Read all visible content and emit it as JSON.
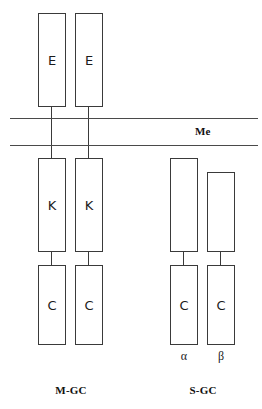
{
  "figure": {
    "membrane": {
      "label": "Me",
      "line_color": "#4a4a4a"
    },
    "box_color": "#3a3a3a",
    "groups": [
      {
        "caption": "M-GC",
        "chains": [
          {
            "name": "m-gc-chain-1",
            "domains": [
              {
                "label": "E"
              },
              {
                "label": "K"
              },
              {
                "label": "C"
              }
            ],
            "subunit": ""
          },
          {
            "name": "m-gc-chain-2",
            "domains": [
              {
                "label": "E"
              },
              {
                "label": "K"
              },
              {
                "label": "C"
              }
            ],
            "subunit": ""
          }
        ]
      },
      {
        "caption": "S-GC",
        "chains": [
          {
            "name": "s-gc-chain-alpha",
            "domains": [
              {
                "label": ""
              },
              {
                "label": "C"
              }
            ],
            "subunit": "α"
          },
          {
            "name": "s-gc-chain-beta",
            "domains": [
              {
                "label": ""
              },
              {
                "label": "C"
              }
            ],
            "subunit": "β"
          }
        ]
      }
    ]
  }
}
